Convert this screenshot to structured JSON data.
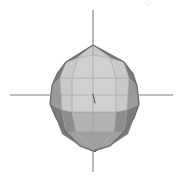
{
  "figure": {
    "kind": "3d-render",
    "subject_label": "faceted-sphere-polyhedron",
    "width": 183,
    "height": 184,
    "background_color": "#ffffff"
  },
  "scene": {
    "object": {
      "name": "geodesic-sphere",
      "center_x": 95,
      "center_y": 97,
      "radius_x": 53,
      "radius_y": 53,
      "outline_color": "#6e6e6e",
      "outline_width": 1.4,
      "band_colors": {
        "top_cap": "#b9b9b9",
        "upper_band": "#c9c9c9",
        "equator_light": "#d0d0d0",
        "equator_dark": "#9a9a9a",
        "lower_band": "#b2b2b2",
        "lower_dark": "#8d8d8d",
        "bottom_cap": "#a0a0a0",
        "rim_dark": "#7a7a7a",
        "shadow_dark": "#1e1e1e"
      }
    },
    "axes": {
      "color": "#9b9b9b",
      "width": 1.2,
      "horizontal": {
        "x1": 10,
        "y1": 95,
        "x2": 173,
        "y2": 95
      },
      "vertical": {
        "x1": 93,
        "y1": 10,
        "x2": 93,
        "y2": 172
      }
    },
    "center_marker": {
      "name": "origin-tick",
      "x": 93,
      "y": 99,
      "color": "#555555"
    },
    "corner_mark": {
      "name": "faint-speck",
      "x": 148,
      "y": 3,
      "color": "#d8d8dc"
    }
  },
  "chart_data": {
    "type": "scatter",
    "title": "",
    "xlabel": "",
    "ylabel": "",
    "notes": "3D shaded faceted sphere centered on crossed coordinate axes; no tick labels or legend rendered."
  }
}
